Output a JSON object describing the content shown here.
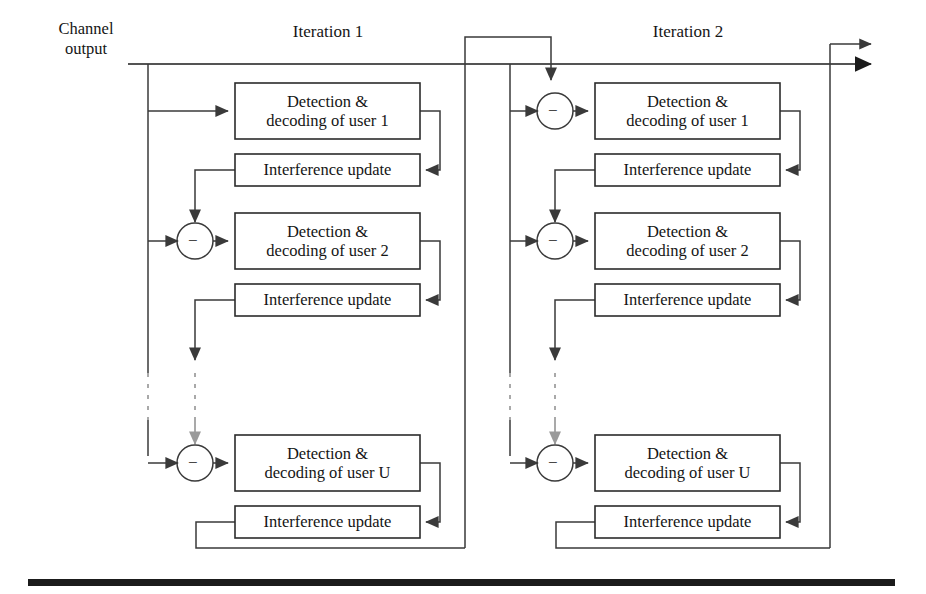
{
  "figure": {
    "type": "block-diagram",
    "channel_output_label": {
      "line1": "Channel",
      "line2": "output"
    },
    "iterations": [
      {
        "title": "Iteration 1",
        "stages": [
          {
            "detection_label_line1": "Detection &",
            "detection_label_line2": "decoding of user 1",
            "interference_label": "Interference update",
            "has_adder": false,
            "adder_sign": ""
          },
          {
            "detection_label_line1": "Detection &",
            "detection_label_line2": "decoding of user 2",
            "interference_label": "Interference update",
            "has_adder": true,
            "adder_sign": "−"
          },
          {
            "detection_label_line1": "Detection &",
            "detection_label_line2": "decoding of user U",
            "interference_label": "Interference update",
            "has_adder": true,
            "adder_sign": "−"
          }
        ]
      },
      {
        "title": "Iteration 2",
        "stages": [
          {
            "detection_label_line1": "Detection &",
            "detection_label_line2": "decoding of user 1",
            "interference_label": "Interference update",
            "has_adder": true,
            "adder_sign": "−"
          },
          {
            "detection_label_line1": "Detection &",
            "detection_label_line2": "decoding of user 2",
            "interference_label": "Interference update",
            "has_adder": true,
            "adder_sign": "−"
          },
          {
            "detection_label_line1": "Detection &",
            "detection_label_line2": "decoding of user U",
            "interference_label": "Interference update",
            "has_adder": true,
            "adder_sign": "−"
          }
        ]
      }
    ],
    "ellipsis_note": "vertical dashed lines indicate users 3 through U-1 omitted",
    "colors": {
      "stroke": "#3a3a3a",
      "box_stroke": "#2b2b2b",
      "text": "#151515",
      "rule": "#1b1b1b",
      "background": "#ffffff"
    }
  }
}
